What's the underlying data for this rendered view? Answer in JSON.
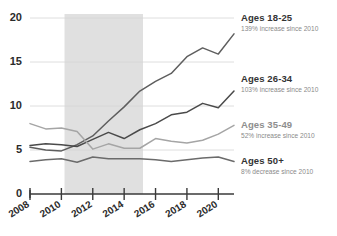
{
  "chart_data": {
    "type": "line",
    "title": "",
    "subtitle": "",
    "xlabel": "",
    "ylabel": "",
    "xlim": [
      2008,
      2021
    ],
    "ylim": [
      0,
      20
    ],
    "yticks": [
      0,
      5,
      10,
      15,
      20
    ],
    "xticks": [
      2008,
      2010,
      2012,
      2014,
      2016,
      2018,
      2020
    ],
    "grid": true,
    "legend_position": "right-inline",
    "x": [
      2008,
      2009,
      2010,
      2011,
      2012,
      2013,
      2014,
      2015,
      2016,
      2017,
      2018,
      2019,
      2020,
      2021
    ],
    "annotations": [
      {
        "name": "recession-band",
        "x_start": 2010.2,
        "x_end": 2015.2,
        "color": "#e0e0e0"
      }
    ],
    "series": [
      {
        "name": "Ages 18-25",
        "note": "139% increase since 2010",
        "color": "#5e5e5e",
        "values": [
          5.3,
          5.0,
          4.9,
          5.6,
          6.6,
          8.3,
          9.9,
          11.7,
          12.8,
          13.7,
          15.6,
          16.6,
          15.9,
          18.2
        ]
      },
      {
        "name": "Ages 26-34",
        "note": "103% increase since 2010",
        "color": "#4a4a4a",
        "values": [
          5.5,
          5.7,
          5.6,
          5.4,
          6.2,
          7.0,
          6.3,
          7.3,
          8.0,
          9.0,
          9.3,
          10.3,
          9.8,
          11.7
        ]
      },
      {
        "name": "Ages 35-49",
        "note": "52% increase since 2010",
        "color": "#a5a5a5",
        "values": [
          8.0,
          7.4,
          7.5,
          7.1,
          5.1,
          5.7,
          5.2,
          5.2,
          6.3,
          6.0,
          5.8,
          6.1,
          6.8,
          7.8
        ]
      },
      {
        "name": "Ages 50+",
        "note": "8% decrease since 2010",
        "color": "#6b6b6b",
        "values": [
          3.7,
          3.9,
          4.0,
          3.6,
          4.2,
          4.0,
          4.0,
          4.0,
          3.9,
          3.7,
          3.9,
          4.1,
          4.2,
          3.7
        ]
      }
    ]
  },
  "axes": {
    "y_labels": [
      "20",
      "15",
      "10",
      "5",
      "0"
    ],
    "x_labels": [
      "2008",
      "2010",
      "2012",
      "2014",
      "2016",
      "2018",
      "2020"
    ]
  },
  "legend": {
    "entries": [
      {
        "title": "Ages 18-25",
        "sub": "139% increase since 2010"
      },
      {
        "title": "Ages 26-34",
        "sub": "103% increase since 2010"
      },
      {
        "title": "Ages 35-49",
        "sub": "52% increase since 2010"
      },
      {
        "title": "Ages 50+",
        "sub": "8% decrease since 2010"
      }
    ]
  }
}
